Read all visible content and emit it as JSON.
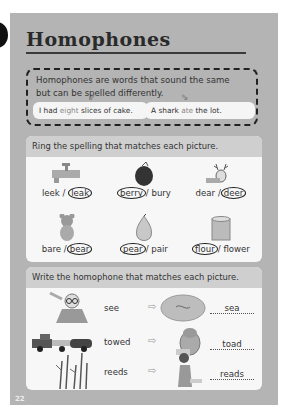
{
  "page": {
    "title": "Homophones",
    "page_number": "22",
    "background_color": "#b4b4b4"
  },
  "intro": {
    "text": "Homophones are words that sound the same but can be spelled differently.",
    "examples": [
      {
        "before": "I had ",
        "highlight": "eight",
        "after": " slices of cake."
      },
      {
        "before": "A shark ",
        "highlight": "ate",
        "after": " the lot."
      }
    ]
  },
  "ring_section": {
    "instruction": "Ring the spelling that matches each picture.",
    "items": [
      {
        "picture": "tap-icon",
        "option1": "leek",
        "option2": "leak",
        "ringed": "leak"
      },
      {
        "picture": "berry-icon",
        "option1": "berry",
        "option2": "bury",
        "ringed": "berry"
      },
      {
        "picture": "deer-icon",
        "option1": "dear",
        "option2": "deer",
        "ringed": "deer"
      },
      {
        "picture": "teddy-bear-icon",
        "option1": "bare",
        "option2": "bear",
        "ringed": "bear"
      },
      {
        "picture": "pear-icon",
        "option1": "pear",
        "option2": "pair",
        "ringed": "pear"
      },
      {
        "picture": "flour-bag-icon",
        "option1": "flour",
        "option2": "flower",
        "ringed": "flour"
      }
    ]
  },
  "write_section": {
    "instruction": "Write the homophone that matches each picture.",
    "rows": [
      {
        "left_picture": "man-seeing-icon",
        "word": "see",
        "arrow": "⇨",
        "right_picture": "sea-icon",
        "answer": "sea"
      },
      {
        "left_picture": "tow-truck-icon",
        "word": "towed",
        "arrow": "⇨",
        "right_picture": "toad-icon",
        "answer": "toad"
      },
      {
        "left_picture": "reeds-icon",
        "word": "reeds",
        "arrow": "⇨",
        "right_picture": "girl-reading-icon",
        "answer": "reads"
      }
    ]
  }
}
